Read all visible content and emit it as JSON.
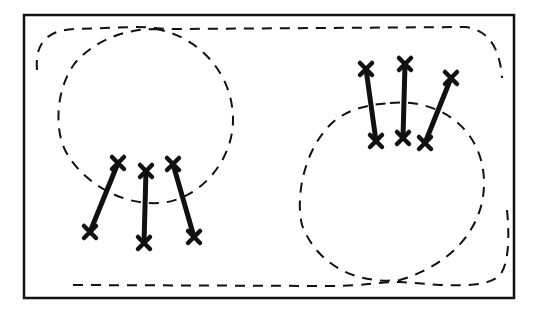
{
  "diagram": {
    "frame": {
      "x": 24,
      "y": 15,
      "width": 490,
      "height": 283,
      "stroke": "#111111"
    },
    "outline_dashed": {
      "stroke": "#111111"
    },
    "regions": [
      {
        "id": "left-circle",
        "cx": 146,
        "cy": 110,
        "rx": 90,
        "ry": 88
      },
      {
        "id": "right-circle",
        "cx": 400,
        "cy": 195,
        "rx": 96,
        "ry": 85
      }
    ],
    "arrow_groups": [
      {
        "id": "left-group",
        "arrows": [
          {
            "x1": 118,
            "y1": 163,
            "x2": 90,
            "y2": 232
          },
          {
            "x1": 146,
            "y1": 171,
            "x2": 144,
            "y2": 243
          },
          {
            "x1": 173,
            "y1": 164,
            "x2": 194,
            "y2": 237
          }
        ]
      },
      {
        "id": "right-group",
        "arrows": [
          {
            "x1": 366,
            "y1": 69,
            "x2": 376,
            "y2": 141
          },
          {
            "x1": 405,
            "y1": 64,
            "x2": 403,
            "y2": 138
          },
          {
            "x1": 451,
            "y1": 78,
            "x2": 425,
            "y2": 143
          }
        ]
      }
    ]
  }
}
